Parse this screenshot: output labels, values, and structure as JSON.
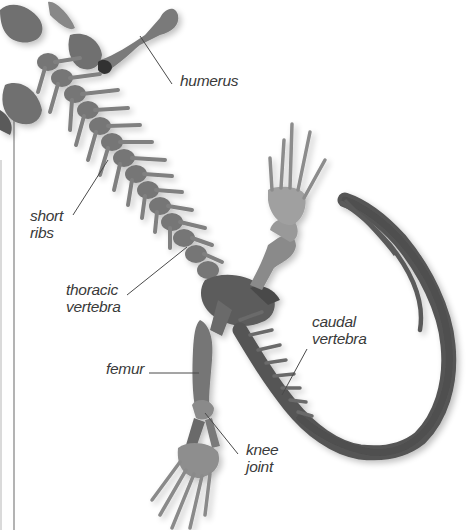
{
  "diagram": {
    "colors": {
      "background": "#ffffff",
      "bone_dark": "#5e5e5e",
      "bone_mid": "#7d7d7d",
      "bone_light": "#a9a9a9",
      "label_text": "#3a3a3a",
      "leader_line": "#4a4a4a",
      "frame_line": "#9a9a9a"
    },
    "labels": [
      {
        "id": "humerus",
        "lines": [
          "humerus"
        ]
      },
      {
        "id": "short-ribs",
        "lines": [
          "short",
          "ribs"
        ]
      },
      {
        "id": "thoracic-vertebra",
        "lines": [
          "thoracic",
          "vertebra"
        ]
      },
      {
        "id": "caudal-vertebra",
        "lines": [
          "caudal",
          "vertebra"
        ]
      },
      {
        "id": "femur",
        "lines": [
          "femur"
        ]
      },
      {
        "id": "knee-joint",
        "lines": [
          "knee",
          "joint"
        ]
      }
    ]
  }
}
